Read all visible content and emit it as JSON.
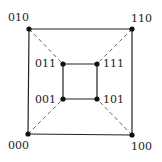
{
  "diagram": {
    "title": "",
    "nodes": [
      {
        "id": "000",
        "label": "000",
        "x": 28,
        "y": 134
      },
      {
        "id": "100",
        "label": "100",
        "x": 132,
        "y": 135
      },
      {
        "id": "010",
        "label": "010",
        "x": 29,
        "y": 29
      },
      {
        "id": "110",
        "label": "110",
        "x": 132,
        "y": 29
      },
      {
        "id": "001",
        "label": "001",
        "x": 63,
        "y": 99
      },
      {
        "id": "101",
        "label": "101",
        "x": 97,
        "y": 99
      },
      {
        "id": "011",
        "label": "011",
        "x": 63,
        "y": 64
      },
      {
        "id": "111",
        "label": "111",
        "x": 97,
        "y": 64
      }
    ],
    "solid_edges": [
      [
        "000",
        "100"
      ],
      [
        "100",
        "110"
      ],
      [
        "110",
        "010"
      ],
      [
        "010",
        "000"
      ],
      [
        "001",
        "101"
      ],
      [
        "101",
        "111"
      ],
      [
        "111",
        "011"
      ],
      [
        "011",
        "001"
      ]
    ],
    "dashed_edges": [
      [
        "000",
        "001"
      ],
      [
        "100",
        "101"
      ],
      [
        "010",
        "011"
      ],
      [
        "110",
        "111"
      ]
    ]
  }
}
